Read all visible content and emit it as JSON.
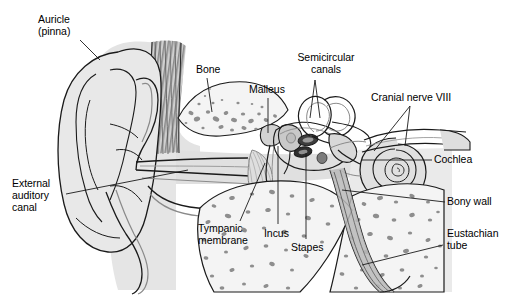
{
  "figure": {
    "kind": "anatomical-illustration",
    "caption": "",
    "background_color": "#ffffff",
    "line_color": "#1a1a1a",
    "palette": {
      "tissue_light": "#e9e9e9",
      "tissue_mid": "#d6d6d6",
      "tissue_dark": "#b5b5b5",
      "cartilage_stripe": "#8a8a8a",
      "bone_fill": "#f2f2f2",
      "bone_speckle": "#8e8e8e",
      "membrane": "#9c9c9c",
      "text": "#000000"
    }
  },
  "labels": [
    {
      "id": "auricle",
      "name": "auricle-pinna",
      "text": "Auricle\n(pinna)",
      "lines": [
        "Auricle",
        "(pinna)"
      ],
      "x": 38,
      "y": 14,
      "align": "left",
      "leader": [
        [
          80,
          40
        ],
        [
          100,
          60
        ]
      ]
    },
    {
      "id": "bone",
      "name": "bone",
      "text": "Bone",
      "lines": [
        "Bone"
      ],
      "x": 196,
      "y": 64,
      "align": "left",
      "leader": [
        [
          207,
          78
        ],
        [
          212,
          112
        ]
      ]
    },
    {
      "id": "malleus",
      "name": "malleus",
      "text": "Malleus",
      "lines": [
        "Malleus"
      ],
      "x": 249,
      "y": 84,
      "align": "left",
      "leader": [
        [
          268,
          98
        ],
        [
          268,
          133
        ]
      ]
    },
    {
      "id": "semicircular_canals",
      "name": "semicircular-canals",
      "text": "Semicircular\ncanals",
      "lines": [
        "Semicircular",
        "canals"
      ],
      "x": 300,
      "y": 52,
      "align": "left",
      "leader": [
        [
          315,
          78
        ],
        [
          310,
          116
        ]
      ],
      "leader2": [
        [
          315,
          78
        ],
        [
          319,
          118
        ]
      ]
    },
    {
      "id": "cranial_nerve_viii",
      "name": "cranial-nerve-viii",
      "text": "Cranial nerve VIII",
      "lines": [
        "Cranial nerve VIII"
      ],
      "x": 371,
      "y": 92,
      "align": "left",
      "leader": [
        [
          408,
          106
        ],
        [
          375,
          150
        ]
      ],
      "leader2": [
        [
          408,
          106
        ],
        [
          404,
          145
        ]
      ]
    },
    {
      "id": "cochlea",
      "name": "cochlea",
      "text": "Cochlea",
      "lines": [
        "Cochlea"
      ],
      "x": 434,
      "y": 154,
      "align": "left",
      "leader": [
        [
          432,
          160
        ],
        [
          362,
          160
        ]
      ]
    },
    {
      "id": "bony_wall",
      "name": "bony-wall",
      "text": "Bony wall",
      "lines": [
        "Bony wall"
      ],
      "x": 447,
      "y": 196,
      "align": "left",
      "leader": [
        [
          445,
          202
        ],
        [
          342,
          190
        ]
      ]
    },
    {
      "id": "eustachian_tube",
      "name": "eustachian-tube",
      "text": "Eustachian\ntube",
      "lines": [
        "Eustachian",
        "tube"
      ],
      "x": 447,
      "y": 228,
      "align": "left",
      "leader": [
        [
          445,
          245
        ],
        [
          363,
          264
        ]
      ]
    },
    {
      "id": "external_auditory_canal",
      "name": "external-auditory-canal",
      "text": "External\nauditory\ncanal",
      "lines": [
        "External",
        "auditory",
        "canal"
      ],
      "x": 12,
      "y": 178,
      "align": "left",
      "leader": [
        [
          66,
          194
        ],
        [
          188,
          170
        ]
      ]
    },
    {
      "id": "tympanic_membrane",
      "name": "tympanic-membrane",
      "text": "Tympanic\nmembrane",
      "lines": [
        "Tympanic",
        "membrane"
      ],
      "x": 198,
      "y": 223,
      "align": "left",
      "leader": [
        [
          240,
          222
        ],
        [
          264,
          163
        ]
      ]
    },
    {
      "id": "incus",
      "name": "incus",
      "text": "Incus",
      "lines": [
        "Incus"
      ],
      "x": 264,
      "y": 228,
      "align": "left",
      "leader": [
        [
          278,
          225
        ],
        [
          278,
          145
        ]
      ]
    },
    {
      "id": "stapes",
      "name": "stapes",
      "text": "Stapes",
      "lines": [
        "Stapes"
      ],
      "x": 291,
      "y": 242,
      "align": "left",
      "leader": [
        [
          306,
          240
        ],
        [
          306,
          152
        ]
      ]
    }
  ],
  "structures": [
    {
      "name": "auricle",
      "label": "Auricle (pinna)"
    },
    {
      "name": "external-auditory-canal",
      "label": "External auditory canal"
    },
    {
      "name": "tympanic-membrane",
      "label": "Tympanic membrane"
    },
    {
      "name": "malleus",
      "label": "Malleus"
    },
    {
      "name": "incus",
      "label": "Incus"
    },
    {
      "name": "stapes",
      "label": "Stapes"
    },
    {
      "name": "semicircular-canals",
      "label": "Semicircular canals"
    },
    {
      "name": "cochlea",
      "label": "Cochlea"
    },
    {
      "name": "cranial-nerve-viii",
      "label": "Cranial nerve VIII"
    },
    {
      "name": "eustachian-tube",
      "label": "Eustachian tube"
    },
    {
      "name": "bony-wall",
      "label": "Bony wall"
    },
    {
      "name": "temporal-bone",
      "label": "Bone"
    }
  ]
}
